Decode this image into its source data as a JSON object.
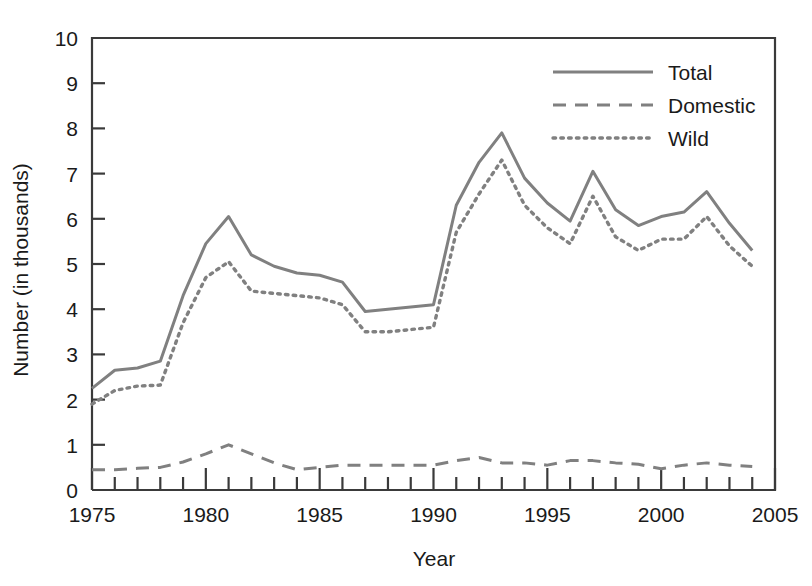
{
  "chart_data": {
    "type": "line",
    "title": "",
    "subtitle": "",
    "xlabel": "Year",
    "ylabel": "Number (in thousands)",
    "xlim": [
      1975,
      2005
    ],
    "ylim": [
      0,
      10
    ],
    "grid": false,
    "legend_position": "top-right",
    "y_ticks": [
      "0",
      "1",
      "2",
      "3",
      "4",
      "5",
      "6",
      "7",
      "8",
      "9",
      "10"
    ],
    "y_tick_values": [
      0,
      1,
      2,
      3,
      4,
      5,
      6,
      7,
      8,
      9,
      10
    ],
    "x_ticks": [
      "1975",
      "1980",
      "1985",
      "1990",
      "1995",
      "2000",
      "2005"
    ],
    "x_tick_values": [
      1975,
      1980,
      1985,
      1990,
      1995,
      2000,
      2005
    ],
    "x_minor_tick_step": 1,
    "line_color": "#808080",
    "axis_color": "#3a3a3a",
    "x": [
      1975,
      1976,
      1977,
      1978,
      1979,
      1980,
      1981,
      1982,
      1983,
      1984,
      1985,
      1986,
      1987,
      1988,
      1989,
      1990,
      1991,
      1992,
      1993,
      1994,
      1995,
      1996,
      1997,
      1998,
      1999,
      2000,
      2001,
      2002,
      2003,
      2004
    ],
    "series": [
      {
        "name": "Total",
        "style": "solid",
        "color": "#808080",
        "values": [
          2.25,
          2.65,
          2.7,
          2.85,
          4.3,
          5.45,
          6.05,
          5.2,
          4.95,
          4.8,
          4.75,
          4.6,
          3.95,
          4.0,
          4.05,
          4.1,
          6.3,
          7.25,
          7.9,
          6.9,
          6.35,
          5.95,
          7.05,
          6.2,
          5.85,
          6.05,
          6.15,
          6.6,
          5.9,
          5.3
        ]
      },
      {
        "name": "Domestic",
        "style": "dashed",
        "color": "#808080",
        "values": [
          0.45,
          0.45,
          0.48,
          0.5,
          0.62,
          0.8,
          1.0,
          0.8,
          0.6,
          0.45,
          0.5,
          0.55,
          0.55,
          0.55,
          0.55,
          0.55,
          0.65,
          0.72,
          0.6,
          0.6,
          0.55,
          0.65,
          0.65,
          0.6,
          0.57,
          0.47,
          0.55,
          0.6,
          0.55,
          0.52
        ]
      },
      {
        "name": "Wild",
        "style": "dotted",
        "color": "#808080",
        "values": [
          1.9,
          2.2,
          2.3,
          2.32,
          3.7,
          4.7,
          5.05,
          4.4,
          4.35,
          4.3,
          4.25,
          4.1,
          3.5,
          3.5,
          3.55,
          3.6,
          5.7,
          6.55,
          7.3,
          6.3,
          5.8,
          5.45,
          6.5,
          5.6,
          5.3,
          5.55,
          5.55,
          6.05,
          5.4,
          4.95
        ]
      }
    ]
  },
  "legend": {
    "items": [
      {
        "label": "Total",
        "style": "solid"
      },
      {
        "label": "Domestic",
        "style": "dashed"
      },
      {
        "label": "Wild",
        "style": "dotted"
      }
    ]
  }
}
